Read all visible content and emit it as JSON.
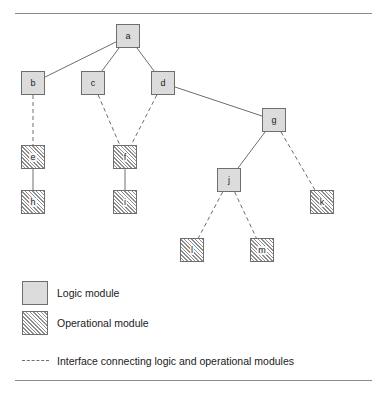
{
  "diagram": {
    "type": "tree-hierarchy",
    "title": "",
    "nodes": [
      {
        "id": "a",
        "label": "a",
        "kind": "logic",
        "x": 116,
        "y": 24
      },
      {
        "id": "b",
        "label": "b",
        "kind": "logic",
        "x": 21,
        "y": 71
      },
      {
        "id": "c",
        "label": "c",
        "kind": "logic",
        "x": 81,
        "y": 71
      },
      {
        "id": "d",
        "label": "d",
        "kind": "logic",
        "x": 151,
        "y": 71
      },
      {
        "id": "g",
        "label": "g",
        "kind": "logic",
        "x": 262,
        "y": 108
      },
      {
        "id": "e",
        "label": "e",
        "kind": "operational",
        "x": 21,
        "y": 145
      },
      {
        "id": "f",
        "label": "f",
        "kind": "operational",
        "x": 113,
        "y": 145
      },
      {
        "id": "j",
        "label": "j",
        "kind": "logic",
        "x": 217,
        "y": 168
      },
      {
        "id": "h",
        "label": "h",
        "kind": "operational",
        "x": 21,
        "y": 190
      },
      {
        "id": "i",
        "label": "i",
        "kind": "operational",
        "x": 113,
        "y": 190
      },
      {
        "id": "k",
        "label": "k",
        "kind": "operational",
        "x": 310,
        "y": 190
      },
      {
        "id": "l",
        "label": "l",
        "kind": "operational",
        "x": 180,
        "y": 238
      },
      {
        "id": "m",
        "label": "m",
        "kind": "operational",
        "x": 250,
        "y": 238
      }
    ],
    "edges": [
      {
        "from": "a",
        "to": "b",
        "style": "solid"
      },
      {
        "from": "a",
        "to": "c",
        "style": "solid"
      },
      {
        "from": "a",
        "to": "d",
        "style": "solid"
      },
      {
        "from": "d",
        "to": "g",
        "style": "solid"
      },
      {
        "from": "b",
        "to": "e",
        "style": "dashed"
      },
      {
        "from": "c",
        "to": "f",
        "style": "dashed"
      },
      {
        "from": "d",
        "to": "f",
        "style": "dashed"
      },
      {
        "from": "e",
        "to": "h",
        "style": "solid"
      },
      {
        "from": "f",
        "to": "i",
        "style": "solid"
      },
      {
        "from": "g",
        "to": "j",
        "style": "solid"
      },
      {
        "from": "g",
        "to": "k",
        "style": "dashed"
      },
      {
        "from": "j",
        "to": "l",
        "style": "dashed"
      },
      {
        "from": "j",
        "to": "m",
        "style": "dashed"
      }
    ],
    "colors": {
      "logic_fill": "#dcdcdc",
      "operational_hatch": "#8e8e8e",
      "node_border": "#6e6e6e",
      "edge": "#6e6e6e",
      "rule": "#8a8a8a",
      "text": "#1a1a1a"
    }
  },
  "legend": {
    "items": [
      {
        "swatch": "logic",
        "label": "Logic module"
      },
      {
        "swatch": "operational",
        "label": "Operational module"
      },
      {
        "swatch": "dashed-line",
        "label": "Interface connecting logic and operational modules"
      }
    ]
  }
}
